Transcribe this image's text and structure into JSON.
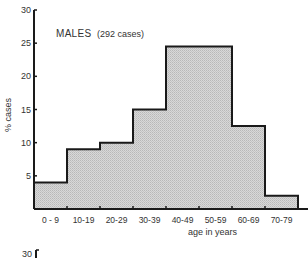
{
  "chart_data": {
    "type": "bar",
    "title": "MALES",
    "subtitle": "(292 cases)",
    "xlabel": "age in years",
    "ylabel": "% cases",
    "ylim": [
      0,
      30
    ],
    "yticks": [
      5,
      10,
      15,
      20,
      25,
      30
    ],
    "grid": false,
    "legend": null,
    "categories": [
      "0 - 9",
      "10-19",
      "20-29",
      "30-39",
      "40-49",
      "50-59",
      "60-69",
      "70-79"
    ],
    "values": [
      4,
      9,
      10,
      15,
      24.5,
      24.5,
      12.5,
      2
    ],
    "fill_color": "#cfcfcf",
    "edge_color": "#1a1a1a"
  },
  "next_panel": {
    "ytick_top": "30"
  }
}
